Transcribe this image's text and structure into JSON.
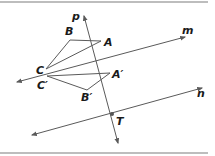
{
  "diagram": {
    "type": "geometry-reflection",
    "colors": {
      "line": "#5a5a5a",
      "label": "#1a1a1a",
      "border": "#bdbdbd",
      "point": "#555555"
    },
    "lines": {
      "p": {
        "label": "p",
        "from": [
          118,
          143
        ],
        "to": [
          84,
          16
        ],
        "label_pos": [
          72,
          20
        ]
      },
      "m": {
        "label": "m",
        "from": [
          17,
          82
        ],
        "to": [
          185,
          37
        ],
        "label_pos": [
          182,
          34
        ]
      },
      "n": {
        "label": "n",
        "from": [
          32,
          135
        ],
        "to": [
          202,
          88
        ],
        "label_pos": [
          197,
          97
        ]
      }
    },
    "triangle_original": {
      "A": {
        "label": "A",
        "pt": [
          101,
          41
        ],
        "label_pos": [
          104,
          46
        ]
      },
      "B": {
        "label": "B",
        "pt": [
          70,
          40
        ],
        "label_pos": [
          65,
          35
        ]
      },
      "C": {
        "label": "C",
        "pt": [
          46,
          69
        ],
        "label_pos": [
          36,
          74
        ]
      }
    },
    "triangle_image": {
      "A_prime": {
        "label": "A′",
        "pt": [
          110,
          73
        ],
        "label_pos": [
          112,
          78
        ]
      },
      "B_prime": {
        "label": "B′",
        "pt": [
          87,
          90
        ],
        "label_pos": [
          81,
          101
        ]
      },
      "C_prime": {
        "label": "C′",
        "pt": [
          47,
          76
        ],
        "label_pos": [
          37,
          89
        ]
      }
    },
    "point_T": {
      "label": "T",
      "pt": [
        112,
        114
      ],
      "label_pos": [
        116,
        125
      ]
    }
  }
}
